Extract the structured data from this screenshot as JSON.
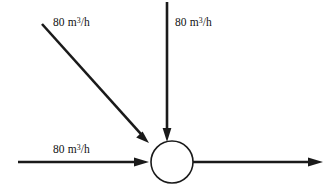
{
  "diagram": {
    "background_color": "#ffffff",
    "line_color": "#1a1a1a",
    "node_fill_color": "#ffffff",
    "unit_label": "80 m3/h",
    "labels": {
      "diagonal_inlet": {
        "value": "80",
        "unit_prefix": " m",
        "exponent": "3",
        "unit_suffix": "/h"
      },
      "vertical_inlet": {
        "value": "80",
        "unit_prefix": " m",
        "exponent": "3",
        "unit_suffix": "/h"
      },
      "horizontal_inlet": {
        "value": "80",
        "unit_prefix": " m",
        "exponent": "3",
        "unit_suffix": "/h"
      }
    },
    "node": {
      "center_x": 172,
      "center_y": 162,
      "radius": 21
    },
    "streams": [
      {
        "name": "diagonal-inlet",
        "direction": "down-right",
        "flow": "80 m3/h",
        "labeled": true
      },
      {
        "name": "vertical-inlet",
        "direction": "down",
        "flow": "80 m3/h",
        "labeled": true
      },
      {
        "name": "horizontal-inlet",
        "direction": "right",
        "flow": "80 m3/h",
        "labeled": true
      },
      {
        "name": "outlet",
        "direction": "right",
        "flow": "",
        "labeled": false
      }
    ]
  }
}
